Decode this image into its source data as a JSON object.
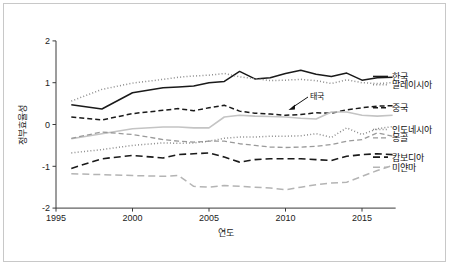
{
  "figure": {
    "background_color": "#ffffff",
    "border_color": "#c8c8c8"
  },
  "axes": {
    "x_title": "연도",
    "y_title": "정부효율성",
    "x_ticks": [
      "1995",
      "2000",
      "2005",
      "2010",
      "2015"
    ],
    "y_ticks": [
      "2",
      "1",
      "0",
      "-1",
      "-2"
    ]
  },
  "annotation": {
    "label": "태국",
    "target_series": "태국"
  },
  "series_labels": [
    {
      "name": "한국"
    },
    {
      "name": "말레이시아"
    },
    {
      "name": "중국"
    },
    {
      "name": "인도네시아"
    },
    {
      "name": "몽골"
    },
    {
      "name": "캄보디아"
    },
    {
      "name": "미얀마"
    }
  ],
  "chart_data": {
    "type": "line",
    "title": "",
    "xlabel": "연도",
    "ylabel": "정부효율성",
    "xlim": [
      1995,
      2017
    ],
    "ylim": [
      -2,
      2
    ],
    "grid": false,
    "legend_position": "right-inline-labels",
    "x": [
      1996,
      1998,
      2000,
      2002,
      2003,
      2004,
      2005,
      2006,
      2007,
      2008,
      2009,
      2010,
      2011,
      2012,
      2013,
      2014,
      2015,
      2016,
      2017
    ],
    "series": [
      {
        "name": "한국",
        "color": "#1a1a1a",
        "style": "solid",
        "label_y_value": 1.15,
        "values": [
          0.47,
          0.37,
          0.76,
          0.88,
          0.9,
          0.92,
          1.0,
          1.03,
          1.27,
          1.09,
          1.12,
          1.22,
          1.3,
          1.2,
          1.15,
          1.23,
          1.06,
          1.12,
          1.13
        ]
      },
      {
        "name": "말레이시아",
        "color": "#8c8c8c",
        "style": "dotted",
        "label_y_value": 0.95,
        "values": [
          0.56,
          0.84,
          0.99,
          1.08,
          1.13,
          1.16,
          1.18,
          1.22,
          1.14,
          1.1,
          1.05,
          1.06,
          1.08,
          1.05,
          0.98,
          1.07,
          1.0,
          0.98,
          1.0
        ]
      },
      {
        "name": "중국",
        "color": "#1a1a1a",
        "style": "dashed",
        "label_y_value": 0.4,
        "values": [
          0.18,
          0.11,
          0.26,
          0.34,
          0.38,
          0.33,
          0.4,
          0.46,
          0.32,
          0.27,
          0.25,
          0.22,
          0.24,
          0.28,
          0.27,
          0.35,
          0.4,
          0.44,
          0.45
        ]
      },
      {
        "name": "태국",
        "color": "#c4c4c4",
        "style": "solid-light",
        "label_y_value": 0.24,
        "values": [
          -0.34,
          -0.22,
          -0.1,
          -0.06,
          -0.06,
          -0.08,
          -0.08,
          0.18,
          0.22,
          0.2,
          0.19,
          0.18,
          0.15,
          0.13,
          0.3,
          0.3,
          0.22,
          0.2,
          0.22
        ]
      },
      {
        "name": "인도네시아",
        "color": "#8c8c8c",
        "style": "dotted",
        "label_y_value": -0.12,
        "values": [
          -0.68,
          -0.6,
          -0.5,
          -0.44,
          -0.45,
          -0.44,
          -0.4,
          -0.33,
          -0.3,
          -0.3,
          -0.28,
          -0.28,
          -0.27,
          -0.22,
          -0.31,
          -0.08,
          -0.24,
          -0.1,
          -0.05
        ]
      },
      {
        "name": "몽골",
        "color": "#9a9a9a",
        "style": "dashed-light",
        "label_y_value": -0.32,
        "values": [
          -0.33,
          -0.18,
          -0.24,
          -0.36,
          -0.4,
          -0.42,
          -0.4,
          -0.4,
          -0.46,
          -0.5,
          -0.54,
          -0.55,
          -0.54,
          -0.52,
          -0.48,
          -0.4,
          -0.36,
          -0.2,
          -0.28
        ]
      },
      {
        "name": "캄보디아",
        "color": "#1a1a1a",
        "style": "long-dash",
        "label_y_value": -0.78,
        "values": [
          -1.05,
          -0.82,
          -0.74,
          -0.8,
          -0.72,
          -0.7,
          -0.68,
          -0.78,
          -0.9,
          -0.84,
          -0.82,
          -0.82,
          -0.82,
          -0.84,
          -0.86,
          -0.76,
          -0.72,
          -0.7,
          -0.72
        ]
      },
      {
        "name": "미얀마",
        "color": "#b4b4b4",
        "style": "long-dash-light",
        "label_y_value": -1.02,
        "values": [
          -1.18,
          -1.2,
          -1.22,
          -1.24,
          -1.22,
          -1.48,
          -1.5,
          -1.46,
          -1.48,
          -1.5,
          -1.52,
          -1.56,
          -1.5,
          -1.44,
          -1.4,
          -1.38,
          -1.24,
          -1.1,
          -0.98
        ]
      }
    ]
  }
}
